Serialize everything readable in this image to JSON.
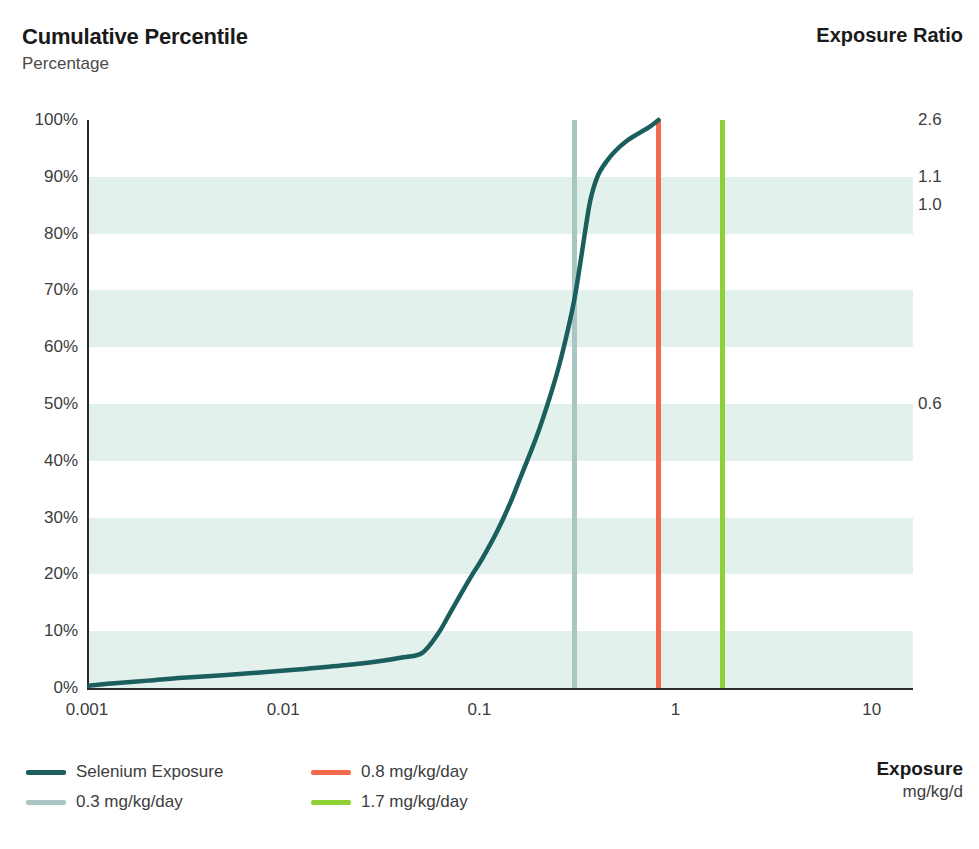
{
  "header": {
    "title": "Cumulative Percentile",
    "subtitle": "Percentage",
    "right_title": "Exposure Ratio"
  },
  "axis_titles": {
    "x_title": "Exposure",
    "x_units": "mg/kg/d"
  },
  "footnote": "",
  "legend": {
    "items": [
      {
        "label": "Selenium Exposure",
        "color": "#1b5e5e"
      },
      {
        "label": "0.8 mg/kg/day",
        "color": "#f3694b"
      },
      {
        "label": "0.3 mg/kg/day",
        "color": "#a9c6c3"
      },
      {
        "label": "1.7 mg/kg/day",
        "color": "#8ed135"
      }
    ]
  },
  "colors": {
    "curve": "#1b5e5e",
    "ref_03": "#a9c6c3",
    "ref_08": "#f3694b",
    "ref_17": "#8ed135",
    "band": "#e2f1ec",
    "axis": "#2a2a2a"
  },
  "chart_data": {
    "type": "line",
    "title": "Cumulative Percentile",
    "subtitle": "Percentage",
    "xlabel": "Exposure",
    "xunits": "mg/kg/d",
    "ylabel": "Percentage",
    "xscale": "log",
    "xlim": [
      0.001,
      15.85
    ],
    "ylim": [
      0,
      100
    ],
    "grid": "horizontal-bands",
    "legend_position": "bottom-left",
    "x_ticks": [
      "0.001",
      "0.01",
      "0.1",
      "1",
      "10"
    ],
    "x_tick_values": [
      0.001,
      0.01,
      0.1,
      1,
      10
    ],
    "y_ticks": [
      "0%",
      "10%",
      "20%",
      "30%",
      "40%",
      "50%",
      "60%",
      "70%",
      "80%",
      "90%",
      "100%"
    ],
    "y_tick_values": [
      0,
      10,
      20,
      30,
      40,
      50,
      60,
      70,
      80,
      90,
      100
    ],
    "right_axis": {
      "title": "Exposure Ratio",
      "ticks": [
        {
          "label": "2.6",
          "percentile": 100
        },
        {
          "label": "1.1",
          "percentile": 90
        },
        {
          "label": "1.0",
          "percentile": 85
        },
        {
          "label": "0.6",
          "percentile": 50
        }
      ]
    },
    "series": [
      {
        "name": "Selenium Exposure",
        "color": "#1b5e5e",
        "points": [
          {
            "x": 0.001,
            "y": 0.4
          },
          {
            "x": 0.0013,
            "y": 0.8
          },
          {
            "x": 0.002,
            "y": 1.3
          },
          {
            "x": 0.003,
            "y": 1.8
          },
          {
            "x": 0.005,
            "y": 2.3
          },
          {
            "x": 0.008,
            "y": 2.8
          },
          {
            "x": 0.012,
            "y": 3.3
          },
          {
            "x": 0.02,
            "y": 4.0
          },
          {
            "x": 0.03,
            "y": 4.7
          },
          {
            "x": 0.04,
            "y": 5.4
          },
          {
            "x": 0.05,
            "y": 6.2
          },
          {
            "x": 0.06,
            "y": 9.5
          },
          {
            "x": 0.07,
            "y": 13.5
          },
          {
            "x": 0.08,
            "y": 17.0
          },
          {
            "x": 0.09,
            "y": 20.0
          },
          {
            "x": 0.1,
            "y": 22.5
          },
          {
            "x": 0.12,
            "y": 27.5
          },
          {
            "x": 0.14,
            "y": 32.5
          },
          {
            "x": 0.16,
            "y": 37.5
          },
          {
            "x": 0.19,
            "y": 44.0
          },
          {
            "x": 0.22,
            "y": 50.5
          },
          {
            "x": 0.25,
            "y": 57.0
          },
          {
            "x": 0.28,
            "y": 64.0
          },
          {
            "x": 0.3,
            "y": 69.0
          },
          {
            "x": 0.32,
            "y": 75.0
          },
          {
            "x": 0.34,
            "y": 81.0
          },
          {
            "x": 0.36,
            "y": 86.0
          },
          {
            "x": 0.39,
            "y": 90.0
          },
          {
            "x": 0.43,
            "y": 92.5
          },
          {
            "x": 0.48,
            "y": 94.5
          },
          {
            "x": 0.55,
            "y": 96.3
          },
          {
            "x": 0.63,
            "y": 97.6
          },
          {
            "x": 0.72,
            "y": 98.8
          },
          {
            "x": 0.8,
            "y": 100
          }
        ]
      }
    ],
    "reference_lines": [
      {
        "label": "0.3 mg/kg/day",
        "x": 0.3,
        "color": "#a9c6c3"
      },
      {
        "label": "0.8 mg/kg/day",
        "x": 0.8,
        "color": "#f3694b"
      },
      {
        "label": "1.7 mg/kg/day",
        "x": 1.7,
        "color": "#8ed135"
      }
    ]
  }
}
